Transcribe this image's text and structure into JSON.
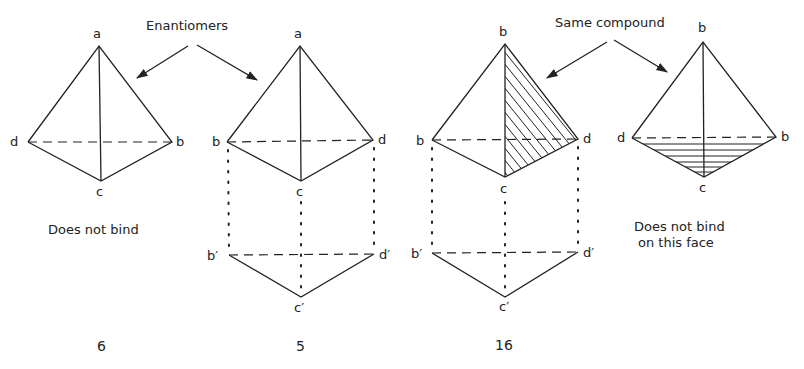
{
  "annotations": {
    "enantiomers": "Enantiomers",
    "same_compound": "Same compound"
  },
  "structures": [
    {
      "id": "6",
      "number": "6",
      "caption": "Does not bind",
      "vertices": {
        "top": "a",
        "left": "d",
        "right": "b",
        "bottom": "c"
      },
      "shaded_face": null,
      "projection": null
    },
    {
      "id": "5",
      "number": "5",
      "caption": "",
      "vertices": {
        "top": "a",
        "left": "b",
        "right": "d",
        "bottom": "c"
      },
      "shaded_face": null,
      "projection": {
        "left": "b′",
        "right": "d′",
        "bottom": "c′"
      }
    },
    {
      "id": "16",
      "number": "16",
      "caption": "",
      "vertices": {
        "top": "b",
        "left": "b",
        "right": "d",
        "bottom": "c"
      },
      "shaded_face": "b-c-d",
      "projection": {
        "left": "b′",
        "right": "d′",
        "bottom": "c′"
      }
    },
    {
      "id": "16-rotated",
      "number": "",
      "caption_line1": "Does not bind",
      "caption_line2": "on this face",
      "vertices": {
        "top": "b",
        "left": "d",
        "right": "b",
        "bottom": "c"
      },
      "shaded_face": "d-b-c"
    }
  ],
  "colors": {
    "ink": "#222222",
    "background": "#ffffff"
  }
}
